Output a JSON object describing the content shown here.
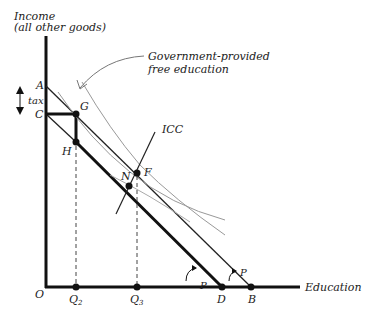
{
  "axes": {
    "y_label_line1": "Income",
    "y_label_line2": "(all other goods)",
    "x_label": "Education",
    "origin": "O"
  },
  "annotation": {
    "line1": "Government-provided",
    "line2": "free education"
  },
  "points": {
    "A": "A",
    "C": "C",
    "G": "G",
    "H": "H",
    "F": "F",
    "N": "N",
    "D": "D",
    "B": "B",
    "Q2": "Q",
    "Q2_sub": "2",
    "Q3": "Q",
    "Q3_sub": "3"
  },
  "labels": {
    "tax": "tax",
    "icc": "ICC",
    "p1": "P",
    "p2": "P"
  },
  "colors": {
    "axis": "#111111",
    "budget": "#222222",
    "indifference": "#999999",
    "dashed": "#444444"
  }
}
